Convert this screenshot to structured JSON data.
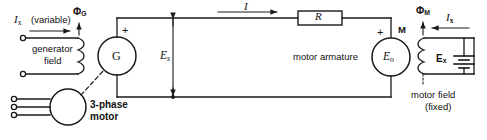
{
  "diagram": {
    "stroke_color": "#1a1a1a",
    "text_color": "#111111",
    "background": "#ffffff"
  },
  "labels": {
    "ix_left": "I",
    "ix_left_sub": "x",
    "variable": "(variable)",
    "phi_g": "Φ",
    "phi_g_sub": "G",
    "generator_field_line1": "generator",
    "generator_field_line2": "field",
    "generator_symbol": "G",
    "plus_generator": "+",
    "es": "E",
    "es_sub": "s",
    "three_phase_line1": "3-phase",
    "three_phase_line2": "motor",
    "current_i": "I",
    "resistor": "R",
    "motor_armature": "motor armature",
    "motor_symbol": "M",
    "plus_motor": "+",
    "eo": "E",
    "eo_sub": "o",
    "phi_m": "Φ",
    "phi_m_sub": "M",
    "ix_right": "I",
    "ix_right_sub": "x",
    "ex": "E",
    "ex_sub": "x",
    "motor_field_line1": "motor field",
    "motor_field_line2": "(fixed)"
  }
}
